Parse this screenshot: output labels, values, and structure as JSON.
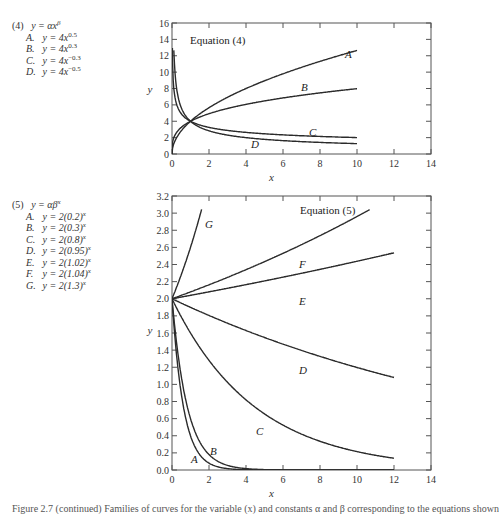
{
  "chart_data": [
    {
      "type": "line",
      "title": "Equation (4)",
      "equation_label": "(4)",
      "equation": "y = αx^β",
      "xlabel": "x",
      "ylabel": "y",
      "xlim": [
        0,
        14
      ],
      "ylim": [
        0,
        16
      ],
      "xticks": [
        0,
        2,
        4,
        6,
        8,
        10,
        12,
        14
      ],
      "yticks": [
        0,
        2,
        4,
        6,
        8,
        10,
        12,
        14,
        16
      ],
      "grid": false,
      "legend_position": "left, outside plot",
      "x_range": [
        0,
        10
      ],
      "series": [
        {
          "name": "A",
          "formula": "y = 4x^0.5",
          "alpha": 4,
          "beta": 0.5,
          "x": [
            0,
            1,
            2,
            4,
            6,
            8,
            10
          ],
          "values": [
            0,
            4,
            5.66,
            8,
            9.8,
            11.31,
            12.65
          ]
        },
        {
          "name": "B",
          "formula": "y = 4x^0.3",
          "alpha": 4,
          "beta": 0.3,
          "x": [
            0,
            1,
            2,
            4,
            6,
            8,
            10
          ],
          "values": [
            0,
            4,
            4.92,
            6.06,
            6.74,
            7.46,
            7.25
          ]
        },
        {
          "name": "C",
          "formula": "y = 4x^-0.3",
          "alpha": 4,
          "beta": -0.3,
          "x": [
            0.1,
            1,
            2,
            4,
            6,
            8,
            10
          ],
          "values": [
            6,
            4,
            3.25,
            2.64,
            2.37,
            1.5,
            2.0
          ]
        },
        {
          "name": "D",
          "formula": "y = 4x^-0.5",
          "alpha": 4,
          "beta": -0.5,
          "x": [
            0.1,
            1,
            2,
            4,
            6,
            8,
            10
          ],
          "values": [
            13,
            4,
            2.83,
            2,
            1.63,
            1.41,
            1.26
          ]
        }
      ]
    },
    {
      "type": "line",
      "title": "Equation (5)",
      "equation_label": "(5)",
      "equation": "y = αβ^x",
      "xlabel": "x",
      "ylabel": "y",
      "xlim": [
        0,
        14
      ],
      "ylim": [
        0,
        3.2
      ],
      "xticks": [
        0,
        2,
        4,
        6,
        8,
        10,
        12,
        14
      ],
      "yticks": [
        0,
        0.2,
        0.4,
        0.6,
        0.8,
        1.0,
        1.2,
        1.4,
        1.6,
        1.8,
        2.0,
        2.2,
        2.4,
        2.6,
        2.8,
        3.0,
        3.2
      ],
      "grid": false,
      "legend_position": "left, outside plot",
      "x_range": [
        0,
        12
      ],
      "series": [
        {
          "name": "A",
          "formula": "y = 2(0.2)^x",
          "alpha": 2,
          "beta": 0.2,
          "x": [
            0,
            0.5,
            1,
            2,
            4,
            6
          ],
          "values": [
            2.0,
            0.89,
            0.4,
            0.08,
            0.003,
            0.0001
          ]
        },
        {
          "name": "B",
          "formula": "y = 2(0.3)^x",
          "alpha": 2,
          "beta": 0.3,
          "x": [
            0,
            0.5,
            1,
            2,
            4,
            6
          ],
          "values": [
            2.0,
            1.1,
            0.6,
            0.18,
            0.016,
            0.0015
          ]
        },
        {
          "name": "C",
          "formula": "y = 2(0.8)^x",
          "alpha": 2,
          "beta": 0.8,
          "x": [
            0,
            2,
            4,
            6,
            8,
            10,
            12
          ],
          "values": [
            2.0,
            1.28,
            0.82,
            0.52,
            0.34,
            0.21,
            0.14
          ]
        },
        {
          "name": "D",
          "formula": "y = 2(0.95)^x",
          "alpha": 2,
          "beta": 0.95,
          "x": [
            0,
            2,
            4,
            6,
            8,
            10,
            12
          ],
          "values": [
            2.0,
            1.81,
            1.63,
            1.47,
            1.33,
            1.2,
            1.08
          ]
        },
        {
          "name": "E",
          "formula": "y = 2(1.02)^x",
          "alpha": 2,
          "beta": 1.02,
          "x": [
            0,
            2,
            4,
            6,
            8,
            10,
            12
          ],
          "values": [
            2.0,
            2.08,
            2.16,
            2.25,
            2.34,
            2.44,
            2.54
          ]
        },
        {
          "name": "F",
          "formula": "y = 2(1.04)^x",
          "alpha": 2,
          "beta": 1.04,
          "x": [
            0,
            2,
            4,
            6,
            8,
            10,
            12
          ],
          "values": [
            2.0,
            2.16,
            2.34,
            2.53,
            2.74,
            2.96,
            3.2
          ]
        },
        {
          "name": "G",
          "formula": "y = 2(1.3)^x",
          "alpha": 2,
          "beta": 1.3,
          "x": [
            0,
            0.5,
            1,
            1.5
          ],
          "values": [
            2.0,
            2.28,
            2.6,
            2.96
          ]
        }
      ]
    }
  ],
  "legend4": {
    "head_num": "(4)",
    "head_eq": "y = αx",
    "head_sup": "β",
    "items": [
      {
        "label": "A.",
        "eq": "y = 4x",
        "sup": "0.5"
      },
      {
        "label": "B.",
        "eq": "y = 4x",
        "sup": "0.3"
      },
      {
        "label": "C.",
        "eq": "y = 4x",
        "sup": "−0.3"
      },
      {
        "label": "D.",
        "eq": "y = 4x",
        "sup": "−0.5"
      }
    ]
  },
  "legend5": {
    "head_num": "(5)",
    "head_eq": "y = αβ",
    "head_sup": "x",
    "items": [
      {
        "label": "A.",
        "eq": "y = 2(0.2)",
        "sup": "x"
      },
      {
        "label": "B.",
        "eq": "y = 2(0.3)",
        "sup": "x"
      },
      {
        "label": "C.",
        "eq": "y = 2(0.8)",
        "sup": "x"
      },
      {
        "label": "D.",
        "eq": "y = 2(0.95)",
        "sup": "x"
      },
      {
        "label": "E.",
        "eq": "y = 2(1.02)",
        "sup": "x"
      },
      {
        "label": "F.",
        "eq": "y = 2(1.04)",
        "sup": "x"
      },
      {
        "label": "G.",
        "eq": "y = 2(1.3)",
        "sup": "x"
      }
    ]
  },
  "caption": "Figure 2.7 (continued) Families of curves for the variable (x) and constants α and β corresponding to the equations shown"
}
